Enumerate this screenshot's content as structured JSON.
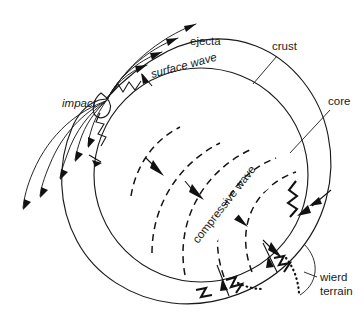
{
  "figure": {
    "background_color": "#ffffff",
    "width": 364,
    "height": 330
  },
  "colors": {
    "background": "#ffffff",
    "crust_fill": "#dcdcdc",
    "core_fill": "#9e9e9e",
    "outline": "#1a1a1a",
    "ink": "#111111",
    "banner_fill": "#ffffff"
  },
  "labels": {
    "ejecta": "ejecta",
    "surface_wave": "surface wave",
    "impact": "impact",
    "crust": "crust",
    "core": "core",
    "compressive_wave": "compressive wave",
    "wierd_terrain_line1": "wierd",
    "wierd_terrain_line2": "terrain"
  },
  "geometry": {
    "planet_center_x": 200,
    "planet_center_y": 172,
    "crust_outer_radius": 133,
    "core_radius": 107,
    "core_center_x": 201,
    "core_center_y": 175,
    "impact_point_x": 106,
    "impact_point_y": 99,
    "antipode_x": 286,
    "antipode_y": 258
  },
  "features": {
    "ejecta_arc_count_upper": 4,
    "ejecta_arc_count_lower": 5,
    "compressive_wavefront_count": 5,
    "fracture_zigzag_count": 5
  }
}
